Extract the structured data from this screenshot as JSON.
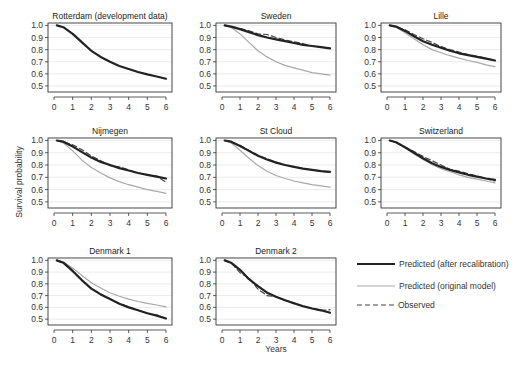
{
  "chart_data": {
    "type": "line",
    "layout": "small-multiples 3x3 grid (8 panels + legend)",
    "xlabel": "Years",
    "ylabel": "Survival probability",
    "xticks": [
      0,
      1,
      2,
      3,
      4,
      5,
      6
    ],
    "yticks": [
      0.5,
      0.6,
      0.7,
      0.8,
      0.9,
      1.0
    ],
    "ytick_labels": [
      "0.5",
      "0.6",
      "0.7",
      "0.8",
      "0.9",
      "1.0"
    ],
    "xlim": [
      0,
      6
    ],
    "ylim": [
      0.45,
      1.02
    ],
    "grid": "horizontal light gridlines",
    "legend_position": "bottom-right cell",
    "legend": [
      {
        "key": "recal",
        "label": "Predicted (after recalibration)",
        "color": "#222222",
        "width": 2.2,
        "dash": ""
      },
      {
        "key": "orig",
        "label": "Predicted (original model)",
        "color": "#a8a8a8",
        "width": 1.2,
        "dash": ""
      },
      {
        "key": "obs",
        "label": "Observed",
        "color": "#444444",
        "width": 1.2,
        "dash": "5,3"
      }
    ],
    "x": [
      0.15,
      0.5,
      1,
      1.5,
      2,
      2.5,
      3,
      3.5,
      4,
      4.5,
      5,
      5.5,
      6
    ],
    "panels": [
      {
        "title": "Rotterdam (development data)",
        "series": {
          "recal": [
            1.0,
            0.985,
            0.93,
            0.86,
            0.79,
            0.74,
            0.7,
            0.665,
            0.64,
            0.615,
            0.595,
            0.578,
            0.56
          ]
        }
      },
      {
        "title": "Sweden",
        "series": {
          "recal": [
            1.0,
            0.99,
            0.97,
            0.945,
            0.92,
            0.9,
            0.885,
            0.87,
            0.855,
            0.84,
            0.83,
            0.82,
            0.81
          ],
          "orig": [
            1.0,
            0.985,
            0.93,
            0.86,
            0.79,
            0.74,
            0.7,
            0.67,
            0.65,
            0.63,
            0.61,
            0.6,
            0.59
          ],
          "obs": [
            1.0,
            0.99,
            0.975,
            0.955,
            0.93,
            0.925,
            0.9,
            0.88,
            0.865,
            0.85,
            0.83,
            0.82,
            0.81
          ]
        }
      },
      {
        "title": "Lille",
        "series": {
          "recal": [
            1.0,
            0.99,
            0.955,
            0.91,
            0.87,
            0.84,
            0.815,
            0.79,
            0.77,
            0.755,
            0.74,
            0.725,
            0.71
          ],
          "orig": [
            1.0,
            0.985,
            0.94,
            0.89,
            0.84,
            0.8,
            0.775,
            0.75,
            0.73,
            0.71,
            0.695,
            0.675,
            0.66
          ],
          "obs": [
            1.0,
            0.99,
            0.965,
            0.925,
            0.89,
            0.86,
            0.825,
            0.8,
            0.78,
            0.76,
            0.745,
            0.73,
            0.71
          ]
        }
      },
      {
        "title": "Nijmegen",
        "series": {
          "recal": [
            1.0,
            0.99,
            0.95,
            0.905,
            0.86,
            0.825,
            0.8,
            0.775,
            0.755,
            0.735,
            0.72,
            0.705,
            0.69
          ],
          "orig": [
            1.0,
            0.98,
            0.915,
            0.84,
            0.78,
            0.735,
            0.695,
            0.665,
            0.64,
            0.62,
            0.6,
            0.585,
            0.57
          ],
          "obs": [
            1.0,
            0.99,
            0.965,
            0.925,
            0.875,
            0.835,
            0.795,
            0.785,
            0.76,
            0.735,
            0.72,
            0.71,
            0.66
          ]
        }
      },
      {
        "title": "St Cloud",
        "series": {
          "recal": [
            1.0,
            0.99,
            0.955,
            0.915,
            0.875,
            0.845,
            0.82,
            0.8,
            0.785,
            0.77,
            0.76,
            0.75,
            0.745
          ],
          "orig": [
            1.0,
            0.98,
            0.92,
            0.855,
            0.795,
            0.75,
            0.715,
            0.69,
            0.67,
            0.655,
            0.64,
            0.63,
            0.62
          ],
          "obs": [
            1.0,
            0.99,
            0.96,
            0.92,
            0.88,
            0.85,
            0.825,
            0.8,
            0.785,
            0.77,
            0.76,
            0.75,
            0.74
          ]
        }
      },
      {
        "title": "Switzerland",
        "series": {
          "recal": [
            1.0,
            0.985,
            0.945,
            0.9,
            0.855,
            0.815,
            0.785,
            0.76,
            0.74,
            0.72,
            0.705,
            0.69,
            0.68
          ],
          "orig": [
            1.0,
            0.985,
            0.94,
            0.89,
            0.845,
            0.805,
            0.77,
            0.745,
            0.72,
            0.7,
            0.685,
            0.67,
            0.655
          ],
          "obs": [
            1.0,
            0.985,
            0.945,
            0.91,
            0.87,
            0.835,
            0.8,
            0.765,
            0.75,
            0.73,
            0.71,
            0.69,
            0.67
          ]
        }
      },
      {
        "title": "Denmark 1",
        "series": {
          "recal": [
            1.0,
            0.98,
            0.91,
            0.83,
            0.76,
            0.71,
            0.67,
            0.63,
            0.6,
            0.575,
            0.55,
            0.53,
            0.505
          ],
          "orig": [
            1.0,
            0.985,
            0.935,
            0.87,
            0.81,
            0.765,
            0.725,
            0.695,
            0.67,
            0.65,
            0.635,
            0.62,
            0.605
          ],
          "obs": [
            1.0,
            0.975,
            0.905,
            0.825,
            0.76,
            0.715,
            0.67,
            0.635,
            0.605,
            0.575,
            0.55,
            0.535,
            0.505
          ]
        }
      },
      {
        "title": "Denmark 2",
        "series": {
          "recal": [
            1.0,
            0.98,
            0.92,
            0.84,
            0.78,
            0.725,
            0.69,
            0.66,
            0.635,
            0.61,
            0.59,
            0.575,
            0.555
          ],
          "orig": [
            1.0,
            0.98,
            0.92,
            0.84,
            0.78,
            0.73,
            0.69,
            0.665,
            0.64,
            0.615,
            0.595,
            0.578,
            0.56
          ],
          "obs": [
            1.0,
            0.98,
            0.895,
            0.85,
            0.755,
            0.7,
            0.69,
            0.66,
            0.63,
            0.61,
            0.59,
            0.575,
            0.58
          ]
        }
      }
    ]
  }
}
